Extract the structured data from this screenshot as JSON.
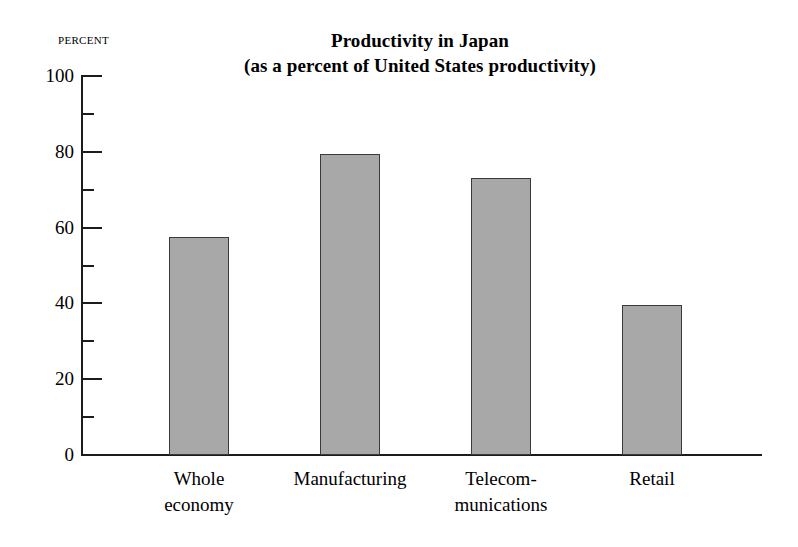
{
  "chart_data": {
    "type": "bar",
    "title": "Productivity in Japan",
    "subtitle": "(as a percent of United States productivity)",
    "ylabel": "Percent",
    "xlabel": "",
    "ylim": [
      0,
      100
    ],
    "ytick_interval": 20,
    "yminor_interval": 10,
    "grid": false,
    "legend": false,
    "categories": [
      "Whole economy",
      "Manufacturing",
      "Telecommunications",
      "Retail"
    ],
    "category_lines": [
      [
        "Whole",
        "economy"
      ],
      [
        "Manufacturing"
      ],
      [
        "Telecom-",
        "munications"
      ],
      [
        "Retail"
      ]
    ],
    "values": [
      57.5,
      79.5,
      73,
      39.5
    ],
    "ytick_labels": [
      "100",
      "80",
      "60",
      "40",
      "20",
      "0"
    ],
    "ytick_values": [
      100,
      80,
      60,
      40,
      20,
      0
    ],
    "bar_fill_color": "#a8a8a8",
    "bar_edge_color": "#3a3a3a",
    "axis_color": "#1c1c1c",
    "background_color": "#ffffff"
  }
}
